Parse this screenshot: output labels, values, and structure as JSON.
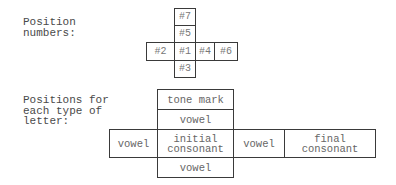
{
  "position_numbers": {
    "label_line1": "Position",
    "label_line2": "numbers:",
    "cells": {
      "top": "#7",
      "upper": "#5",
      "left": "#2",
      "center": "#1",
      "right": "#4",
      "far_right": "#6",
      "bottom": "#3"
    }
  },
  "letter_positions": {
    "label_line1": "Positions for",
    "label_line2": "each type of",
    "label_line3": "letter:",
    "cells": {
      "top": "tone mark",
      "upper": "vowel",
      "left": "vowel",
      "center_line1": "initial",
      "center_line2": "consonant",
      "right": "vowel",
      "far_right_line1": "final",
      "far_right_line2": "consonant",
      "bottom": "vowel"
    }
  }
}
